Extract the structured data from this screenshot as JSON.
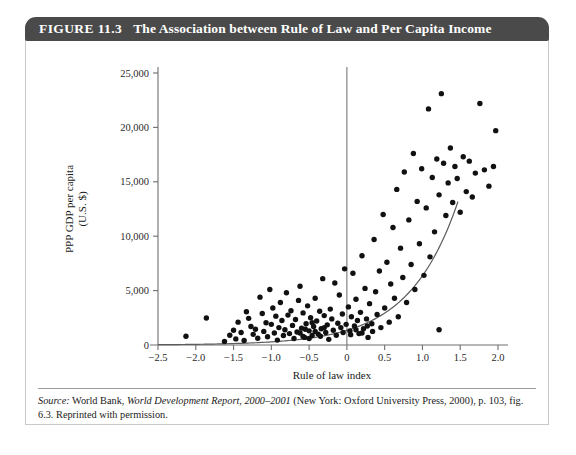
{
  "figure": {
    "number": "FIGURE 11.3",
    "title": "The Association between Rule of Law and Per Capita Income",
    "header_bg": "#4a4a4a",
    "header_fg": "#ffffff"
  },
  "source": {
    "label": "Source:",
    "text_part1": " World Bank, ",
    "italic_title": "World Development Report, 2000–2001",
    "text_part2": " (New York: Oxford University Press, 2000), p. 103, fig. 6.3. Reprinted with permission."
  },
  "chart_data": {
    "type": "scatter",
    "title": "The Association between Rule of Law and Per Capita Income",
    "xlabel": "Rule of law index",
    "ylabel": "PPP GDP per capita (U.S. $)",
    "ylabel_line1": "PPP GDP per capita",
    "ylabel_line2": "(U.S. $)",
    "xlim": [
      -2.5,
      2.0
    ],
    "ylim": [
      0,
      25000
    ],
    "grid": false,
    "legend": false,
    "xticks": [
      -2.5,
      -2.0,
      -1.5,
      -1.0,
      -0.5,
      0,
      0.5,
      1.0,
      1.5,
      2.0
    ],
    "xticklabels": [
      "−2.5",
      "−2.0",
      "−1.5",
      "−1.0",
      "−0.5",
      "0",
      "0.5",
      "1.0",
      "1.5",
      "2.0"
    ],
    "yticks": [
      0,
      5000,
      10000,
      15000,
      20000,
      25000
    ],
    "yticklabels": [
      "0",
      "5,000",
      "10,000",
      "15,000",
      "20,000",
      "25,000"
    ],
    "point_color": "#111111",
    "curve_color": "#5c5c5c",
    "annotations": [
      {
        "name": "zero-reference-line",
        "type": "vline",
        "x": 0,
        "y_from": 0,
        "y_to": 25000
      }
    ],
    "fit_curve": {
      "name": "exponential-fit",
      "type": "exponential",
      "formula": "y = 1350 * exp(1.55 * x)",
      "x_from": -2.5,
      "x_to": 1.47
    },
    "points": [
      [
        -2.13,
        800
      ],
      [
        -1.86,
        2480
      ],
      [
        -1.62,
        330
      ],
      [
        -1.55,
        900
      ],
      [
        -1.5,
        1350
      ],
      [
        -1.47,
        560
      ],
      [
        -1.44,
        2100
      ],
      [
        -1.4,
        1150
      ],
      [
        -1.36,
        420
      ],
      [
        -1.33,
        3050
      ],
      [
        -1.3,
        2450
      ],
      [
        -1.27,
        1700
      ],
      [
        -1.24,
        980
      ],
      [
        -1.21,
        1450
      ],
      [
        -1.18,
        620
      ],
      [
        -1.15,
        4400
      ],
      [
        -1.12,
        2900
      ],
      [
        -1.1,
        1250
      ],
      [
        -1.07,
        2050
      ],
      [
        -1.05,
        760
      ],
      [
        -1.02,
        5100
      ],
      [
        -1.0,
        1900
      ],
      [
        -0.98,
        3400
      ],
      [
        -0.96,
        1100
      ],
      [
        -0.94,
        2650
      ],
      [
        -0.92,
        450
      ],
      [
        -0.9,
        1600
      ],
      [
        -0.88,
        3900
      ],
      [
        -0.86,
        2250
      ],
      [
        -0.84,
        870
      ],
      [
        -0.82,
        1400
      ],
      [
        -0.8,
        4800
      ],
      [
        -0.78,
        2750
      ],
      [
        -0.76,
        1050
      ],
      [
        -0.74,
        3150
      ],
      [
        -0.72,
        1800
      ],
      [
        -0.7,
        600
      ],
      [
        -0.68,
        2350
      ],
      [
        -0.66,
        1200
      ],
      [
        -0.64,
        4100
      ],
      [
        -0.62,
        5400
      ],
      [
        -0.6,
        1550
      ],
      [
        -0.58,
        2950
      ],
      [
        -0.56,
        700
      ],
      [
        -0.54,
        1950
      ],
      [
        -0.52,
        3600
      ],
      [
        -0.5,
        1300
      ],
      [
        -0.48,
        2500
      ],
      [
        -0.46,
        880
      ],
      [
        -0.44,
        1700
      ],
      [
        -0.42,
        4300
      ],
      [
        -0.4,
        2200
      ],
      [
        -0.38,
        1000
      ],
      [
        -0.36,
        3100
      ],
      [
        -0.34,
        1500
      ],
      [
        -0.32,
        6100
      ],
      [
        -0.3,
        2700
      ],
      [
        -0.28,
        1150
      ],
      [
        -0.26,
        1850
      ],
      [
        -0.24,
        520
      ],
      [
        -0.22,
        3300
      ],
      [
        -0.2,
        2400
      ],
      [
        -0.18,
        1350
      ],
      [
        -0.16,
        5700
      ],
      [
        -0.14,
        900
      ],
      [
        -0.12,
        2000
      ],
      [
        -0.1,
        4600
      ],
      [
        -0.08,
        1600
      ],
      [
        -0.06,
        2850
      ],
      [
        -0.05,
        1150
      ],
      [
        -0.03,
        7000
      ],
      [
        -0.01,
        1900
      ],
      [
        0.02,
        3500
      ],
      [
        0.04,
        1300
      ],
      [
        0.06,
        2600
      ],
      [
        0.08,
        6600
      ],
      [
        0.1,
        1750
      ],
      [
        0.12,
        4200
      ],
      [
        0.14,
        2250
      ],
      [
        0.16,
        1050
      ],
      [
        0.18,
        3000
      ],
      [
        0.2,
        8200
      ],
      [
        0.22,
        1500
      ],
      [
        0.24,
        5200
      ],
      [
        0.26,
        2400
      ],
      [
        0.28,
        700
      ],
      [
        0.3,
        3800
      ],
      [
        0.33,
        1950
      ],
      [
        0.36,
        9700
      ],
      [
        0.38,
        4900
      ],
      [
        0.4,
        2800
      ],
      [
        0.43,
        6800
      ],
      [
        0.45,
        1600
      ],
      [
        0.48,
        12000
      ],
      [
        0.5,
        3400
      ],
      [
        0.53,
        7600
      ],
      [
        0.56,
        2100
      ],
      [
        0.58,
        5600
      ],
      [
        0.61,
        10800
      ],
      [
        0.63,
        4300
      ],
      [
        0.66,
        14300
      ],
      [
        0.68,
        2600
      ],
      [
        0.71,
        8900
      ],
      [
        0.74,
        6200
      ],
      [
        0.76,
        15900
      ],
      [
        0.79,
        3900
      ],
      [
        0.82,
        11500
      ],
      [
        0.85,
        7400
      ],
      [
        0.88,
        17600
      ],
      [
        0.9,
        5100
      ],
      [
        0.93,
        13200
      ],
      [
        0.96,
        9300
      ],
      [
        0.99,
        16200
      ],
      [
        1.02,
        6400
      ],
      [
        1.05,
        12600
      ],
      [
        1.08,
        21700
      ],
      [
        1.1,
        8100
      ],
      [
        1.13,
        15400
      ],
      [
        1.16,
        10400
      ],
      [
        1.19,
        17100
      ],
      [
        1.22,
        13800
      ],
      [
        1.25,
        23100
      ],
      [
        1.28,
        16700
      ],
      [
        1.31,
        11900
      ],
      [
        1.34,
        14900
      ],
      [
        1.37,
        18100
      ],
      [
        1.4,
        13100
      ],
      [
        1.43,
        16400
      ],
      [
        1.46,
        15300
      ],
      [
        1.5,
        12200
      ],
      [
        1.54,
        17300
      ],
      [
        1.58,
        14100
      ],
      [
        1.62,
        16900
      ],
      [
        1.66,
        13600
      ],
      [
        1.7,
        15800
      ],
      [
        1.76,
        22200
      ],
      [
        1.82,
        16100
      ],
      [
        1.88,
        14600
      ],
      [
        1.94,
        16400
      ],
      [
        1.97,
        19700
      ],
      [
        -0.62,
        1100
      ],
      [
        -0.58,
        780
      ],
      [
        -0.55,
        1450
      ],
      [
        -0.5,
        600
      ],
      [
        -0.46,
        2050
      ],
      [
        -0.42,
        1250
      ],
      [
        -0.35,
        800
      ],
      [
        -0.3,
        1600
      ],
      [
        0.05,
        950
      ],
      [
        0.12,
        1400
      ],
      [
        0.2,
        1100
      ],
      [
        0.27,
        1750
      ],
      [
        0.34,
        1250
      ],
      [
        1.22,
        1400
      ]
    ]
  }
}
